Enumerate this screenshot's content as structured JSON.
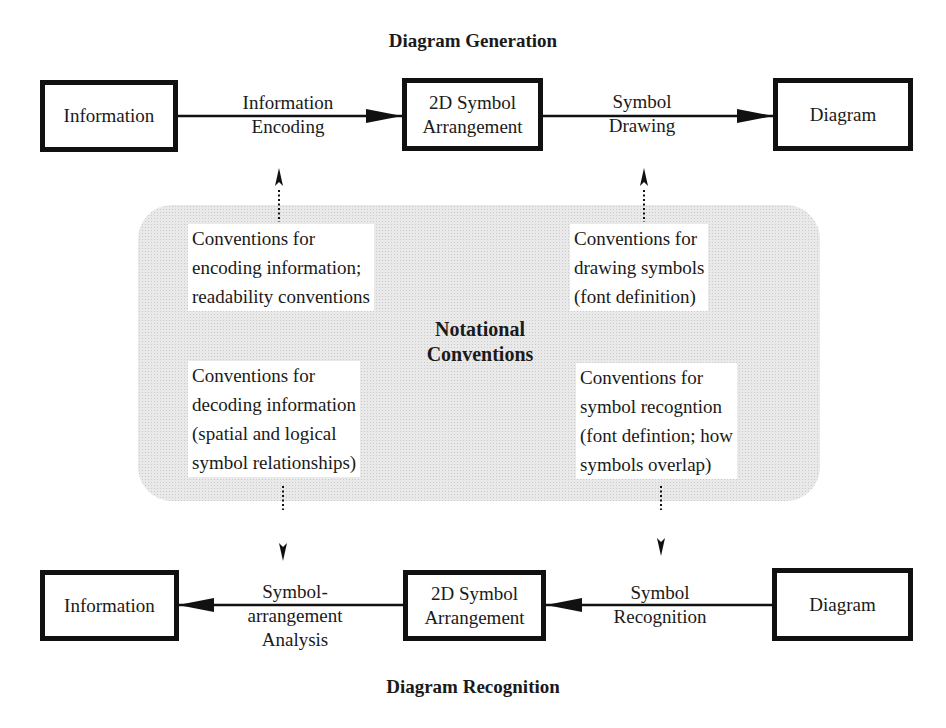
{
  "generation": {
    "title": "Diagram Generation",
    "boxes": {
      "information": {
        "lines": [
          "Information"
        ]
      },
      "arrangement": {
        "lines": [
          "2D Symbol",
          "Arrangement"
        ]
      },
      "diagram": {
        "lines": [
          "Diagram"
        ]
      }
    },
    "edges": {
      "encoding": {
        "lines": [
          "Information",
          "Encoding"
        ]
      },
      "drawing": {
        "lines": [
          "Symbol",
          "Drawing"
        ]
      }
    }
  },
  "conventions": {
    "title_lines": [
      "Notational",
      "Conventions"
    ],
    "encoding": {
      "lines": [
        "Conventions for",
        "encoding information;",
        "readability conventions"
      ]
    },
    "drawing": {
      "lines": [
        "Conventions for",
        "drawing symbols",
        "(font definition)"
      ]
    },
    "decoding": {
      "lines": [
        "Conventions for",
        "decoding information",
        "(spatial and logical",
        "symbol relationships)"
      ]
    },
    "recognition": {
      "lines": [
        "Conventions for",
        "symbol recogntion",
        "(font defintion; how",
        "symbols overlap)"
      ]
    }
  },
  "recognition": {
    "title": "Diagram Recognition",
    "boxes": {
      "information": {
        "lines": [
          "Information"
        ]
      },
      "arrangement": {
        "lines": [
          "2D Symbol",
          "Arrangement"
        ]
      },
      "diagram": {
        "lines": [
          "Diagram"
        ]
      }
    },
    "edges": {
      "analysis": {
        "lines": [
          "Symbol-",
          "arrangement",
          "Analysis"
        ]
      },
      "symbol_recognition": {
        "lines": [
          "Symbol",
          "Recognition"
        ]
      }
    }
  },
  "colors": {
    "stroke": "#111111",
    "shade": "#e9e9e9",
    "background": "#ffffff"
  }
}
